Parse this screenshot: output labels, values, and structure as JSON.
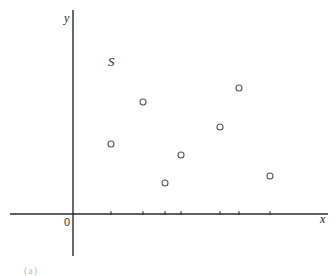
{
  "figure": {
    "set_label": "S",
    "x_axis_label": "x",
    "y_axis_label": "y",
    "origin_label": "0",
    "caption_fragment": "(a)"
  },
  "colors": {
    "axis": "#2a2a2a",
    "point_stroke": "#555555",
    "background": "#ffffff"
  },
  "chart_data": {
    "type": "scatter",
    "title": "",
    "xlabel": "x",
    "ylabel": "y",
    "annotations": [
      "S",
      "0"
    ],
    "grid": false,
    "legend": null,
    "pixel_origin": [
      73,
      214
    ],
    "x_ticks_px": [
      111,
      143,
      165,
      181,
      220,
      239,
      270
    ],
    "points_px": [
      {
        "x": 111,
        "y": 144
      },
      {
        "x": 143,
        "y": 102
      },
      {
        "x": 165,
        "y": 183
      },
      {
        "x": 181,
        "y": 155
      },
      {
        "x": 220,
        "y": 127
      },
      {
        "x": 239,
        "y": 88
      },
      {
        "x": 270,
        "y": 176
      }
    ],
    "points_relative": [
      {
        "x": 38,
        "y": 70
      },
      {
        "x": 70,
        "y": 112
      },
      {
        "x": 92,
        "y": 31
      },
      {
        "x": 108,
        "y": 59
      },
      {
        "x": 147,
        "y": 87
      },
      {
        "x": 166,
        "y": 126
      },
      {
        "x": 197,
        "y": 38
      }
    ]
  }
}
